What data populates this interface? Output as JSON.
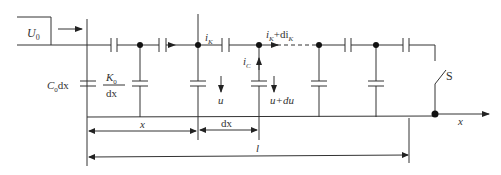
{
  "diagram": {
    "type": "distributed capacitance circuit (ladder network)",
    "source_label": "U",
    "source_subscript": "0",
    "shunt_capacitance_label": {
      "main": "C",
      "sub": "0",
      "suffix": "dx"
    },
    "series_capacitance_label": {
      "numerator_main": "K",
      "numerator_sub": "0",
      "denominator": "dx"
    },
    "current_labels": {
      "i_k": {
        "main": "i",
        "sub": "K"
      },
      "i_k_plus": {
        "main": "i",
        "sub": "K",
        "suffix": "+di",
        "suffix_sub": "K"
      },
      "i_c": {
        "main": "i",
        "sub": "C"
      }
    },
    "voltage_labels": {
      "u": "u",
      "u_plus": "u+du"
    },
    "switch_label": "S",
    "axis_label": "x",
    "dimensions": {
      "x": "x",
      "dx": "dx",
      "l": "l"
    },
    "colors": {
      "line": "#333333",
      "background": "#ffffff"
    }
  }
}
